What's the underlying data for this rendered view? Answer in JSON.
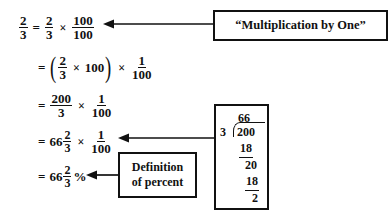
{
  "document": {
    "kind": "math-worked-example",
    "topic": "Converting 2/3 to a percent"
  },
  "equation_lines": [
    {
      "id": "line1",
      "lhs": "2/3",
      "lhs_num": "2",
      "lhs_den": "3",
      "equals": "=",
      "f1_num": "2",
      "f1_den": "3",
      "times": "×",
      "f2_num": "100",
      "f2_den": "100"
    },
    {
      "id": "line2",
      "equals": "=",
      "open_paren": "(",
      "f1_num": "2",
      "f1_den": "3",
      "times_inner": "×",
      "inner_value": "100",
      "close_paren": ")",
      "times_outer": "×",
      "f2_num": "1",
      "f2_den": "100"
    },
    {
      "id": "line3",
      "equals": "=",
      "f1_num": "200",
      "f1_den": "3",
      "times": "×",
      "f2_num": "1",
      "f2_den": "100"
    },
    {
      "id": "line4",
      "equals": "=",
      "whole": "66",
      "f1_num": "2",
      "f1_den": "3",
      "times": "×",
      "f2_num": "1",
      "f2_den": "100"
    },
    {
      "id": "line5",
      "equals": "=",
      "whole": "66",
      "f1_num": "2",
      "f1_den": "3",
      "percent": "%"
    }
  ],
  "callouts": {
    "multiplication_by_one": {
      "label": "“Multiplication by One”"
    },
    "definition_of_percent": {
      "line1": "Definition",
      "line2": "of percent"
    }
  },
  "long_division": {
    "quotient": "66",
    "divisor": "3",
    "dividend": "200",
    "subtract_1": "18",
    "remainder_1": "20",
    "subtract_2": "18",
    "remainder_2": "2"
  },
  "arrows": [
    {
      "name": "arrow-to-line1",
      "from": "multiplication-by-one-box",
      "to": "equation-line-1",
      "direction": "left"
    },
    {
      "name": "arrow-to-line4",
      "from": "long-division-box",
      "to": "equation-line-4",
      "direction": "left"
    },
    {
      "name": "arrow-to-line5",
      "from": "definition-of-percent-box",
      "to": "equation-line-5",
      "direction": "left"
    }
  ],
  "colors": {
    "ink": "#111111",
    "paper": "#ffffff"
  }
}
